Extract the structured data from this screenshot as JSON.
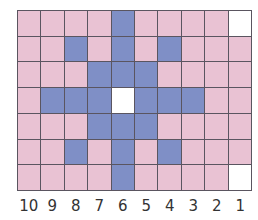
{
  "colors": {
    "P": "#e9c2d3",
    "B": "#7f8fc6",
    "W": "#ffffff",
    "grid_line": "#5a5560"
  },
  "grid": {
    "columns": 10,
    "rows": 7,
    "cells": [
      [
        "P",
        "P",
        "P",
        "P",
        "B",
        "P",
        "P",
        "P",
        "P",
        "W"
      ],
      [
        "P",
        "P",
        "B",
        "P",
        "B",
        "P",
        "B",
        "P",
        "P",
        "P"
      ],
      [
        "P",
        "P",
        "P",
        "B",
        "B",
        "B",
        "P",
        "P",
        "P",
        "P"
      ],
      [
        "P",
        "B",
        "B",
        "B",
        "W",
        "B",
        "B",
        "B",
        "P",
        "P"
      ],
      [
        "P",
        "P",
        "P",
        "B",
        "B",
        "B",
        "P",
        "P",
        "P",
        "P"
      ],
      [
        "P",
        "P",
        "B",
        "P",
        "B",
        "P",
        "B",
        "P",
        "P",
        "P"
      ],
      [
        "P",
        "P",
        "P",
        "P",
        "B",
        "P",
        "P",
        "P",
        "P",
        "W"
      ]
    ]
  },
  "column_labels": [
    "10",
    "9",
    "8",
    "7",
    "6",
    "5",
    "4",
    "3",
    "2",
    "1"
  ]
}
